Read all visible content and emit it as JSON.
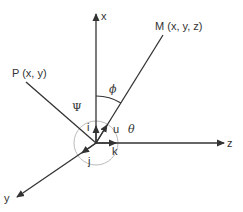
{
  "diagram": {
    "type": "3d-coordinate-system",
    "colors": {
      "line": "#333333",
      "arc": "#aaaaaa",
      "background": "#ffffff"
    },
    "axes": {
      "x": {
        "label": "x"
      },
      "y": {
        "label": "y"
      },
      "z": {
        "label": "z"
      }
    },
    "points": {
      "M": {
        "label": "M (x, y, z)"
      },
      "P": {
        "label": "P (x, y)"
      }
    },
    "unit_vectors": {
      "i": "i",
      "j": "j",
      "k": "k",
      "u": "u"
    },
    "angles": {
      "phi": "ϕ",
      "psi": "Ψ",
      "theta": "θ"
    }
  }
}
